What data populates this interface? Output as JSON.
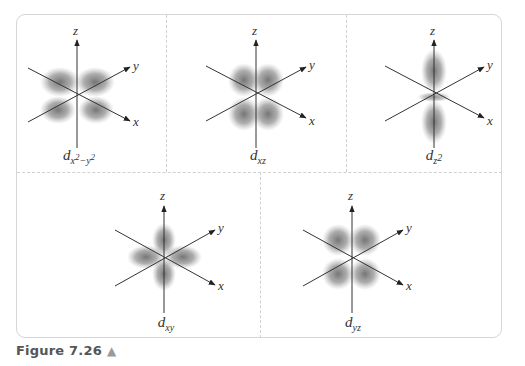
{
  "figure": {
    "caption_label": "Figure 7.26",
    "caption_icon": "up-triangle-icon",
    "colors": {
      "frame_border": "#d6d6d6",
      "divider": "#d0d0d0",
      "axis": "#333333",
      "orbital_shade": "#7a7a7a",
      "caption_text": "#555555",
      "caption_icon": "#9a9a9a"
    }
  },
  "axes": {
    "x": "x",
    "y": "y",
    "z": "z"
  },
  "panels": [
    {
      "id": "dx2-y2",
      "base": "d",
      "sub_main": "x",
      "sup1": "2",
      "sub_sep": "−y",
      "sup2": "2",
      "orbital_type": "four-lobe-in-xy-plane-along-axes"
    },
    {
      "id": "dxz",
      "base": "d",
      "sub": "xz",
      "orbital_type": "four-lobe-in-xz-plane"
    },
    {
      "id": "dz2",
      "base": "d",
      "sub": "z",
      "sup": "2",
      "orbital_type": "dumbbell-along-z-with-torus"
    },
    {
      "id": "dxy",
      "base": "d",
      "sub": "xy",
      "orbital_type": "four-lobe-in-xy-plane-between-axes"
    },
    {
      "id": "dyz",
      "base": "d",
      "sub": "yz",
      "orbital_type": "four-lobe-in-yz-plane"
    }
  ]
}
